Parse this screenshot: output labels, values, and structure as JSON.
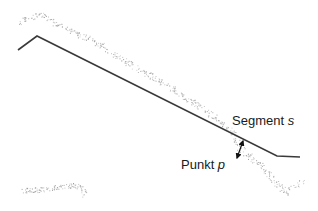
{
  "diagram": {
    "labels": {
      "segment": {
        "text": "Segment ",
        "var": "s"
      },
      "point": {
        "text": "Punkt ",
        "var": "p"
      }
    },
    "segment_polyline": [
      [
        18,
        50
      ],
      [
        37,
        36
      ],
      [
        277,
        156
      ],
      [
        300,
        157
      ]
    ],
    "point_cloud_path": [
      [
        20,
        22
      ],
      [
        30,
        17
      ],
      [
        40,
        15
      ],
      [
        50,
        19
      ],
      [
        62,
        27
      ],
      [
        78,
        34
      ],
      [
        95,
        42
      ],
      [
        115,
        55
      ],
      [
        135,
        67
      ],
      [
        155,
        79
      ],
      [
        175,
        90
      ],
      [
        195,
        103
      ],
      [
        215,
        118
      ],
      [
        232,
        132
      ],
      [
        240,
        148
      ],
      [
        252,
        158
      ],
      [
        265,
        170
      ],
      [
        278,
        186
      ],
      [
        286,
        192
      ],
      [
        295,
        186
      ],
      [
        302,
        182
      ]
    ],
    "point_cloud_lower": [
      [
        20,
        190
      ],
      [
        35,
        190
      ],
      [
        50,
        188
      ],
      [
        65,
        186
      ],
      [
        75,
        185
      ],
      [
        82,
        187
      ],
      [
        84,
        195
      ]
    ],
    "distance_arrow": {
      "from": [
        243,
        141
      ],
      "to": [
        237,
        158
      ]
    },
    "colors": {
      "segment": "#3a3a3a",
      "points": "#8a8a8a",
      "arrow": "#111111",
      "text": "#1a1a1a"
    }
  }
}
